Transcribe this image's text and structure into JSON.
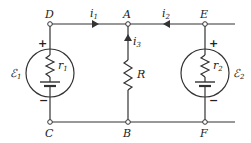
{
  "diagram": {
    "type": "circuit",
    "nodes": {
      "D": "D",
      "A": "A",
      "E": "E",
      "C": "C",
      "B": "B",
      "F": "F"
    },
    "currents": {
      "i1": {
        "sym": "i",
        "sub": "1"
      },
      "i2": {
        "sym": "i",
        "sub": "2"
      },
      "i3": {
        "sym": "i",
        "sub": "3"
      }
    },
    "components": {
      "emf1": {
        "sym": "ℰ",
        "sub": "1",
        "internal_r_sym": "r",
        "internal_r_sub": "1"
      },
      "emf2": {
        "sym": "ℰ",
        "sub": "2",
        "internal_r_sym": "r",
        "internal_r_sub": "2"
      },
      "resistor": {
        "sym": "R"
      }
    },
    "polarity": {
      "plus": "+",
      "minus": "−"
    }
  }
}
